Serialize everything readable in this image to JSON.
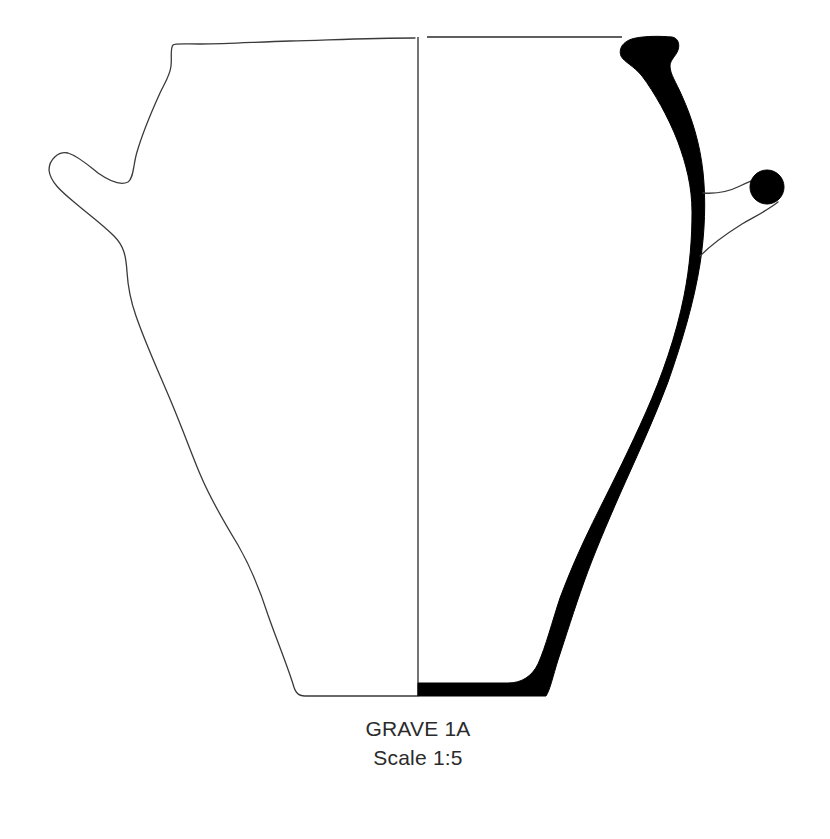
{
  "figure": {
    "caption": {
      "title": "GRAVE 1A",
      "scale": "Scale 1:5"
    },
    "colors": {
      "background": "#ffffff",
      "outline": "#3a3a3a",
      "section": "#000000",
      "text": "#2b2b2b"
    },
    "elements": {
      "exterior_outline": "left half exterior view with lug handle",
      "center_axis": "vertical axis line",
      "rim_line": "rim top line",
      "section_profile": "black wall section (right half)",
      "right_handle": "handle loop with circular section"
    }
  }
}
